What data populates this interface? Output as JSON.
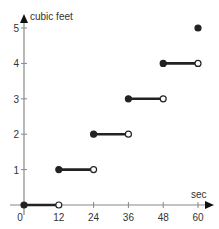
{
  "chart_data": {
    "type": "line",
    "subtype": "step-function",
    "title": "",
    "xlabel": "sec",
    "ylabel": "cubic feet",
    "x_ticks": [
      0,
      12,
      24,
      36,
      48,
      60
    ],
    "y_ticks": [
      1,
      2,
      3,
      4,
      5
    ],
    "x_tick_labels": [
      "0",
      "12",
      "24",
      "36",
      "48",
      "60"
    ],
    "y_tick_labels": [
      "1",
      "2",
      "3",
      "4",
      "5"
    ],
    "xlim": [
      0,
      60
    ],
    "ylim": [
      0,
      5
    ],
    "grid": false,
    "segments": [
      {
        "x_start": 0,
        "x_end": 12,
        "y": 0,
        "start_closed": true,
        "end_closed": false
      },
      {
        "x_start": 12,
        "x_end": 24,
        "y": 1,
        "start_closed": true,
        "end_closed": false
      },
      {
        "x_start": 24,
        "x_end": 36,
        "y": 2,
        "start_closed": true,
        "end_closed": false
      },
      {
        "x_start": 36,
        "x_end": 48,
        "y": 3,
        "start_closed": true,
        "end_closed": false
      },
      {
        "x_start": 48,
        "x_end": 60,
        "y": 4,
        "start_closed": true,
        "end_closed": false
      }
    ],
    "points": [
      {
        "x": 60,
        "y": 5,
        "closed": true
      }
    ]
  },
  "colors": {
    "axis": "#888888",
    "segment": "#222222",
    "text": "#333333"
  }
}
